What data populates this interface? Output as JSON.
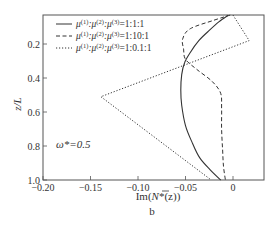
{
  "chart_data": {
    "type": "line",
    "title": "",
    "panel_label": "b",
    "xlabel": "Im(N̄*(z))",
    "ylabel": "z/L",
    "xlim": [
      -0.2,
      0.03
    ],
    "ylim": [
      1.0,
      0.03
    ],
    "y_inverted": true,
    "grid": false,
    "legend_position": "upper left (inside)",
    "x_ticks": [
      -0.2,
      -0.15,
      -0.1,
      -0.05,
      0
    ],
    "x_tick_labels": [
      "−0.20",
      "−0.15",
      "−0.10",
      "−0.05",
      "0"
    ],
    "y_ticks": [
      0.2,
      0.4,
      0.6,
      0.8,
      1.0
    ],
    "y_tick_labels": [
      "0.2",
      "0.4",
      "0.6",
      "0.8",
      "1.0"
    ],
    "annotation": "ω*=0.5",
    "series": [
      {
        "name": "μ(1):μ(2):μ(3)=1:1:1",
        "style": "solid",
        "x": [
          -0.005,
          -0.015,
          -0.025,
          -0.036,
          -0.045,
          -0.051,
          -0.054,
          -0.055,
          -0.054,
          -0.05,
          -0.043,
          -0.035,
          -0.024,
          -0.013
        ],
        "z": [
          0.03,
          0.07,
          0.12,
          0.18,
          0.25,
          0.31,
          0.38,
          0.47,
          0.56,
          0.68,
          0.78,
          0.87,
          0.94,
          1.0
        ]
      },
      {
        "name": "μ(1):μ(2):μ(3)=1:10:1",
        "style": "dashed",
        "x": [
          -0.003,
          -0.02,
          -0.045,
          -0.053,
          -0.052,
          -0.05,
          -0.038,
          -0.022,
          -0.013,
          -0.012,
          -0.012,
          -0.011,
          -0.01,
          -0.008
        ],
        "z": [
          0.03,
          0.06,
          0.11,
          0.17,
          0.23,
          0.29,
          0.35,
          0.42,
          0.49,
          0.58,
          0.7,
          0.82,
          0.92,
          1.0
        ]
      },
      {
        "name": "μ(1):μ(2):μ(3)=1:0.1:1",
        "style": "dotted",
        "x": [
          0.0,
          0.017,
          -0.139,
          -0.023
        ],
        "z": [
          0.03,
          0.18,
          0.51,
          1.0
        ]
      }
    ]
  },
  "legend": {
    "items": [
      {
        "prefix": "μ",
        "sup1": "(1)",
        "sep1": ":μ",
        "sup2": "(2)",
        "sep2": ":μ",
        "sup3": "(3)",
        "ratio": "=1:1:1",
        "style": "solid"
      },
      {
        "prefix": "μ",
        "sup1": "(1)",
        "sep1": ":μ",
        "sup2": "(2)",
        "sep2": ":μ",
        "sup3": "(3)",
        "ratio": "=1:10:1",
        "style": "dashed"
      },
      {
        "prefix": "μ",
        "sup1": "(1)",
        "sep1": ":μ",
        "sup2": "(2)",
        "sep2": ":μ",
        "sup3": "(3)",
        "ratio": "=1:0.1:1",
        "style": "dotted"
      }
    ]
  },
  "labels": {
    "xlabel_prefix": "Im(",
    "xlabel_N": "N",
    "xlabel_suffix": "*(z))",
    "ylabel": "z/L",
    "annotation": "ω*=0.5",
    "panel": "b"
  },
  "colors": {
    "line": "#333333",
    "axis": "#555555"
  }
}
